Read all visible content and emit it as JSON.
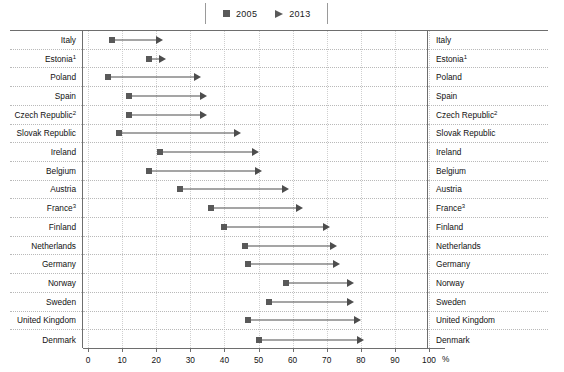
{
  "legend": {
    "items": [
      {
        "label": "2005",
        "marker": "square-marker-icon"
      },
      {
        "label": "2013",
        "marker": "triangle-marker-icon"
      }
    ]
  },
  "axis": {
    "ticks": [
      0,
      10,
      20,
      30,
      40,
      50,
      60,
      70,
      80,
      90,
      100
    ],
    "unit_label": "%",
    "min": 0,
    "max": 100
  },
  "rows": [
    {
      "label": "Italy",
      "sup": "",
      "v2005": 7,
      "v2013": 22
    },
    {
      "label": "Estonia",
      "sup": "1",
      "v2005": 18,
      "v2013": 23
    },
    {
      "label": "Poland",
      "sup": "",
      "v2005": 6,
      "v2013": 33
    },
    {
      "label": "Spain",
      "sup": "",
      "v2005": 12,
      "v2013": 35
    },
    {
      "label": "Czech Republic",
      "sup": "2",
      "v2005": 12,
      "v2013": 35
    },
    {
      "label": "Slovak Republic",
      "sup": "",
      "v2005": 9,
      "v2013": 45
    },
    {
      "label": "Ireland",
      "sup": "",
      "v2005": 21,
      "v2013": 50
    },
    {
      "label": "Belgium",
      "sup": "",
      "v2005": 18,
      "v2013": 51
    },
    {
      "label": "Austria",
      "sup": "",
      "v2005": 27,
      "v2013": 59
    },
    {
      "label": "France",
      "sup": "3",
      "v2005": 36,
      "v2013": 63
    },
    {
      "label": "Finland",
      "sup": "",
      "v2005": 40,
      "v2013": 71
    },
    {
      "label": "Netherlands",
      "sup": "",
      "v2005": 46,
      "v2013": 73
    },
    {
      "label": "Germany",
      "sup": "",
      "v2005": 47,
      "v2013": 74
    },
    {
      "label": "Norway",
      "sup": "",
      "v2005": 58,
      "v2013": 78
    },
    {
      "label": "Sweden",
      "sup": "",
      "v2005": 53,
      "v2013": 78
    },
    {
      "label": "United Kingdom",
      "sup": "",
      "v2005": 47,
      "v2013": 80
    },
    {
      "label": "Denmark",
      "sup": "",
      "v2005": 50,
      "v2013": 81
    }
  ],
  "colors": {
    "marker": "#595959",
    "arrow": "#4d4d4d",
    "frame": "#6e6e6e",
    "grid": "#cfcfcf",
    "row_divider": "#b9b9b9"
  },
  "chart_data": {
    "type": "bar",
    "title": "",
    "subtitle": "",
    "xlabel": "%",
    "ylabel": "",
    "xlim": [
      0,
      100
    ],
    "grid": true,
    "legend_position": "top-center",
    "orientation": "horizontal",
    "categories": [
      "Italy",
      "Estonia¹",
      "Poland",
      "Spain",
      "Czech Republic²",
      "Slovak Republic",
      "Ireland",
      "Belgium",
      "Austria",
      "France³",
      "Finland",
      "Netherlands",
      "Germany",
      "Norway",
      "Sweden",
      "United Kingdom",
      "Denmark"
    ],
    "series": [
      {
        "name": "2005",
        "values": [
          7,
          18,
          6,
          12,
          12,
          9,
          21,
          18,
          27,
          36,
          40,
          46,
          47,
          58,
          53,
          47,
          50
        ]
      },
      {
        "name": "2013",
        "values": [
          22,
          23,
          33,
          35,
          35,
          45,
          50,
          51,
          59,
          63,
          71,
          73,
          74,
          78,
          78,
          80,
          81
        ]
      }
    ],
    "tick_labels": [
      "0",
      "10",
      "20",
      "30",
      "40",
      "50",
      "60",
      "70",
      "80",
      "90",
      "100"
    ],
    "annotations": [
      "Arrows connect the 2005 value (square) to the 2013 value (arrowhead) for each country."
    ]
  }
}
